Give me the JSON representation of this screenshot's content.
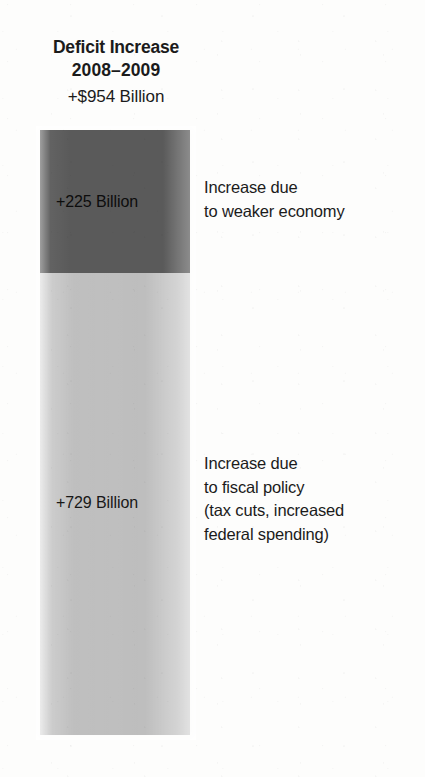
{
  "title": {
    "line1": "Deficit Increase",
    "line2": "2008–2009",
    "subtitle": "+$954 Billion"
  },
  "segments": {
    "economy": {
      "value_label": "+225 Billion",
      "annotation_lines": [
        "Increase due",
        "to weaker economy"
      ]
    },
    "fiscal": {
      "value_label": "+729 Billion",
      "annotation_lines": [
        "Increase due",
        "to fiscal policy",
        "(tax cuts, increased",
        "federal spending)"
      ]
    }
  },
  "colors": {
    "background": "#fdfdfc",
    "segment_economy": "#5a5a5a",
    "segment_fiscal": "#bebebe",
    "text": "#1b1b1b"
  },
  "chart_data": {
    "type": "bar",
    "subtype": "stacked-single-column",
    "title": "Deficit Increase 2008–2009 +$954 Billion",
    "xlabel": "",
    "ylabel": "",
    "unit": "Billion USD",
    "total": 954,
    "total_label": "+$954 Billion",
    "categories": [
      "Deficit Increase 2008–2009"
    ],
    "stack_order_top_to_bottom": [
      "Increase due to weaker economy",
      "Increase due to fiscal policy (tax cuts, increased federal spending)"
    ],
    "series": [
      {
        "name": "Increase due to weaker economy",
        "values": [
          225
        ],
        "data_label": "+225 Billion",
        "share_percent": 23.6,
        "color": "#5a5a5a"
      },
      {
        "name": "Increase due to fiscal policy (tax cuts, increased federal spending)",
        "values": [
          729
        ],
        "data_label": "+729 Billion",
        "share_percent": 76.4,
        "color": "#bebebe"
      }
    ],
    "annotations": [
      {
        "text": "Increase due to weaker economy",
        "target": "Increase due to weaker economy",
        "position": "right"
      },
      {
        "text": "Increase due to fiscal policy (tax cuts, increased federal spending)",
        "target": "Increase due to fiscal policy (tax cuts, increased federal spending)",
        "position": "right"
      }
    ],
    "ylim": [
      0,
      954
    ],
    "grid": false,
    "axis_visible": false,
    "legend": "inline-annotations-right"
  }
}
